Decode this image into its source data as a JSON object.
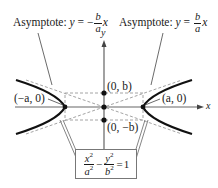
{
  "diagram": {
    "type": "hyperbola",
    "labels": {
      "asymptote_left_prefix": "Asymptote: ",
      "asymptote_left_y": "y",
      "asymptote_left_eq": " = −",
      "asymptote_left_num": "b",
      "asymptote_left_den": "a",
      "asymptote_left_x": "x",
      "asymptote_right_prefix": "Asymptote: ",
      "asymptote_right_y": "y",
      "asymptote_right_eq": " = ",
      "asymptote_right_num": "b",
      "asymptote_right_den": "a",
      "asymptote_right_x": "x",
      "y_axis": "y",
      "x_axis": "x",
      "point_top": "(0, b)",
      "point_bottom": "(0, −b)",
      "vertex_left": "(−a, 0)",
      "vertex_right": "(a, 0)"
    },
    "equation": {
      "x_num": "x",
      "a_den": "a",
      "minus": "−",
      "y_num": "y",
      "b_den": "b",
      "equals": "=",
      "rhs": "1",
      "exp": "2"
    },
    "colors": {
      "curve": "#111111",
      "axes": "#555555",
      "dashed": "#9a9a9a",
      "leader": "#444444"
    }
  }
}
